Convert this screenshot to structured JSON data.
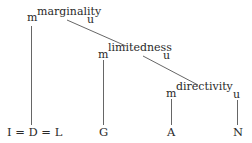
{
  "diagram": {
    "nodes": [
      {
        "id": "marginality",
        "prefix": "m",
        "label": "marginality",
        "suffix": "u"
      },
      {
        "id": "limitedness",
        "prefix": "m",
        "label": "limitedness",
        "suffix": "u"
      },
      {
        "id": "directivity",
        "prefix": "m",
        "label": "directivity",
        "suffix": "u"
      }
    ],
    "leaves": [
      {
        "id": "idl",
        "label": "I = D = L"
      },
      {
        "id": "g",
        "label": "G"
      },
      {
        "id": "a",
        "label": "A"
      },
      {
        "id": "n",
        "label": "N"
      }
    ],
    "edges": [
      {
        "from": "marginality.m",
        "to": "I = D = L"
      },
      {
        "from": "marginality",
        "to": "limitedness"
      },
      {
        "from": "limitedness.m",
        "to": "G"
      },
      {
        "from": "limitedness",
        "to": "directivity"
      },
      {
        "from": "directivity.m",
        "to": "A"
      },
      {
        "from": "directivity.u",
        "to": "N"
      }
    ],
    "line_color": "#555555",
    "text_color": "#2a2a2a"
  }
}
